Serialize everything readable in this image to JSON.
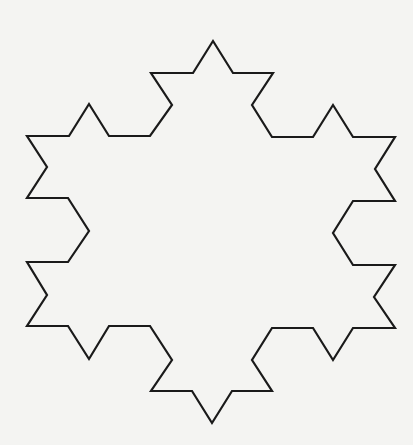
{
  "figure": {
    "label": "Koch snowflake (second iteration)",
    "background_color": "#f4f4f2",
    "stroke_color": "#1a1a1a",
    "stroke_width": 2.2,
    "iteration": 2,
    "vertex_count": 48,
    "points": "213,41 233,73 273,73 252,105 272,137 313,137 333,105 353,137 395,137 375,169 395,201 353,201 333,233 353,265 395,265 374,297 395,328 353,328 333,360 313,328 272,328 252,360 272,391 232,391 212,423 192,391 151,391 172,360 150,326 109,326 89,359 68,326 27,326 47,295 27,262 68,262 89,231 68,198 27,198 47,167 27,136 69,136 89,104 109,136 150,136 172,105 151,73 193,73"
  }
}
